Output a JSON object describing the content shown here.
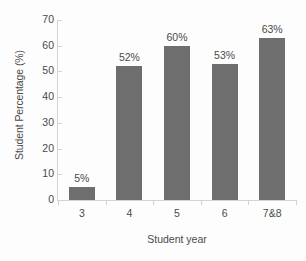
{
  "chart_data": {
    "type": "bar",
    "title": "",
    "subtitle": "",
    "xlabel": "Student year",
    "ylabel": "Student Percentage (%)",
    "categories": [
      "3",
      "4",
      "5",
      "6",
      "7&8"
    ],
    "values": [
      5,
      52,
      60,
      53,
      63
    ],
    "data_labels": [
      "5%",
      "52%",
      "60%",
      "53%",
      "63%"
    ],
    "ylim": [
      0,
      70
    ],
    "ytick_labels": [
      "0",
      "10",
      "20",
      "30",
      "40",
      "50",
      "60",
      "70"
    ],
    "ytick_values": [
      0,
      10,
      20,
      30,
      40,
      50,
      60,
      70
    ],
    "grid": false,
    "legend": false,
    "legend_position": "none",
    "series": [
      {
        "name": "Student Percentage",
        "values": [
          5,
          52,
          60,
          53,
          63
        ]
      }
    ],
    "colors": {
      "bar": "#6f6e6e",
      "axis": "#d3d3d3",
      "text": "#4a4a4a",
      "background": "#fdfdfd"
    }
  }
}
